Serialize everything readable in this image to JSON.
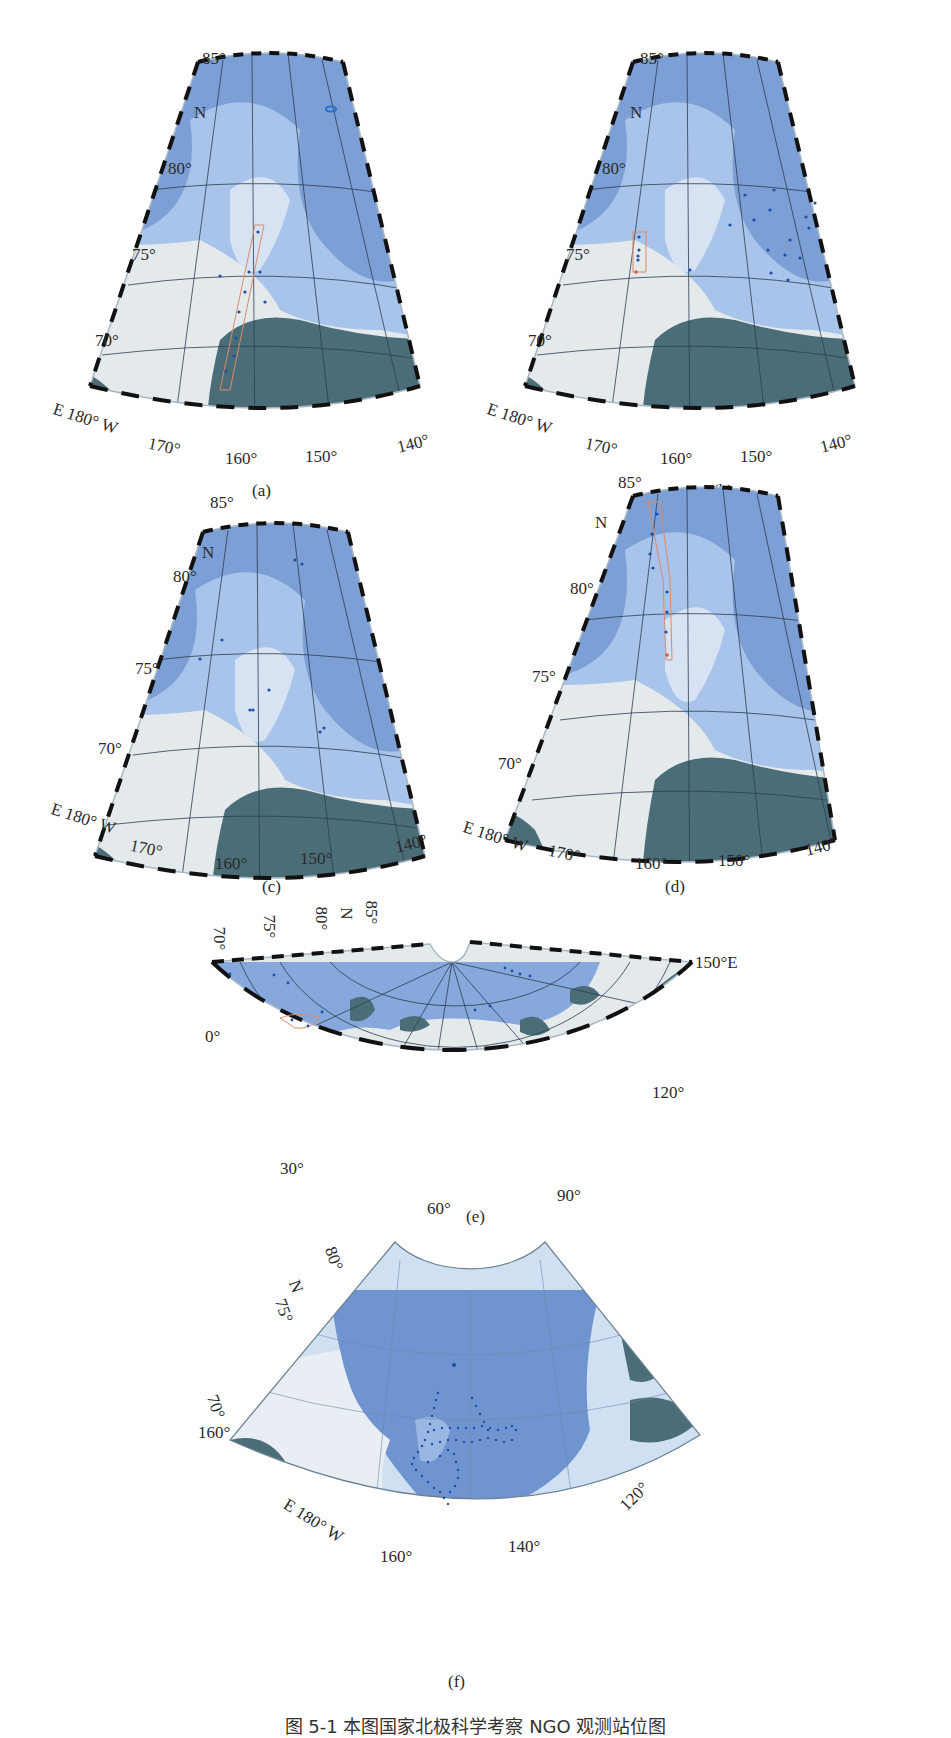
{
  "colors": {
    "deep_ocean": "#6e94cf",
    "mid_ocean": "#8eb0de",
    "shelf": "#bdd3ee",
    "ice_white": "#e6ebee",
    "land": "#4b6d78",
    "grid": "#2c3e50",
    "sample_dot": "#1c4fa8",
    "track_box": "#d98b6a"
  },
  "panels": {
    "a": {
      "label": "(a)",
      "lat_labels": [
        "85°",
        "80°",
        "75°",
        "70°"
      ],
      "north_label": "N",
      "lon_labels": [
        "E 180° W",
        "170°",
        "160°",
        "150°",
        "140°"
      ]
    },
    "b": {
      "label": "(b)",
      "lat_labels": [
        "85°",
        "80°",
        "75°",
        "70°"
      ],
      "north_label": "N",
      "lon_labels": [
        "E 180° W",
        "170°",
        "160°",
        "150°",
        "140°"
      ]
    },
    "c": {
      "label": "(c)",
      "lat_labels": [
        "85°",
        "80°",
        "75°",
        "70°"
      ],
      "north_label": "N",
      "lon_labels": [
        "E 180° W",
        "170°",
        "160°",
        "150°",
        "140°"
      ]
    },
    "d": {
      "label": "(d)",
      "lat_labels": [
        "85°",
        "80°",
        "75°",
        "70°"
      ],
      "north_label": "N",
      "lon_labels": [
        "E 180° W",
        "170°",
        "160°",
        "150°",
        "140°"
      ]
    },
    "e": {
      "label": "(e)",
      "lat_labels": [
        "70°",
        "75°",
        "80°",
        "N",
        "85°"
      ],
      "lon_labels": [
        "150°E",
        "0°",
        "120°",
        "30°",
        "90°",
        "60°"
      ]
    },
    "f": {
      "label": "(f)",
      "lat_labels": [
        "80°",
        "N",
        "75°",
        "70°"
      ],
      "lon_labels": [
        "160°",
        "E 180° W",
        "160°",
        "140°",
        "120°"
      ]
    }
  },
  "figure_caption": "图 5-1  本图国家北极科学考察 NGO 观测站位图"
}
